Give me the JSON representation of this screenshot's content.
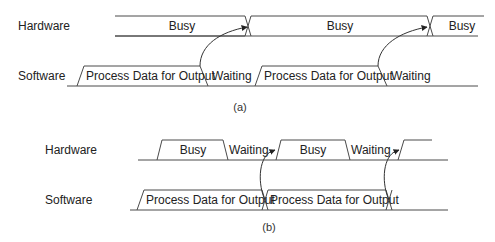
{
  "panel_a": {
    "caption": "(a)",
    "hardware": {
      "label": "Hardware",
      "segments": [
        "Busy",
        "Busy",
        "Busy"
      ]
    },
    "software": {
      "label": "Software",
      "segments": [
        "Process Data for Output",
        "Waiting",
        "Process Data for Output",
        "Waiting"
      ]
    }
  },
  "panel_b": {
    "caption": "(b)",
    "hardware": {
      "label": "Hardware",
      "segments": [
        "Busy",
        "Waiting",
        "Busy",
        "Waiting"
      ]
    },
    "software": {
      "label": "Software",
      "segments": [
        "Process Data for Output",
        "Process Data for Output"
      ]
    }
  },
  "colors": {
    "line": "#4a4a4a",
    "text": "#222222",
    "background": "#ffffff"
  }
}
